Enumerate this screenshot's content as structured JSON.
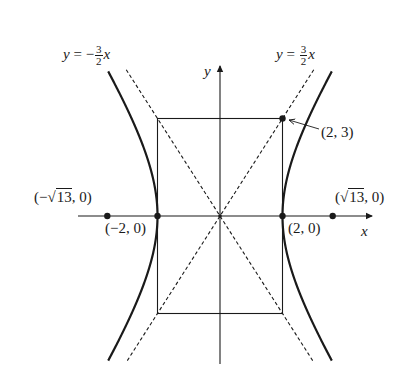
{
  "diagram": {
    "type": "hyperbola",
    "equation_params": {
      "a": 2,
      "b": 3,
      "c_label": "√13"
    },
    "colors": {
      "ink": "#1a1a1a",
      "background": "#ffffff"
    },
    "axes": {
      "x_label": "x",
      "y_label": "y",
      "origin_px": [
        220,
        216
      ],
      "px_per_unit_x": 31.25,
      "px_per_unit_y": 32.5,
      "x_axis_px": [
        78,
        372
      ],
      "y_axis_px": [
        66,
        364
      ]
    },
    "asymptotes": [
      {
        "label_prefix": "y = −",
        "num": "3",
        "den": "2",
        "var": "x",
        "slope": -1.5
      },
      {
        "label_prefix": "y = ",
        "num": "3",
        "den": "2",
        "var": "x",
        "slope": 1.5
      }
    ],
    "points": [
      {
        "label": "(−2, 0)",
        "x": -2,
        "y": 0
      },
      {
        "label": "(2, 0)",
        "x": 2,
        "y": 0
      },
      {
        "label_pre": "(−",
        "label_rad": "13",
        "label_post": ", 0)",
        "x": -3.606,
        "y": 0
      },
      {
        "label_pre": "(",
        "label_rad": "13",
        "label_post": ", 0)",
        "x": 3.606,
        "y": 0
      },
      {
        "label": "(2, 3)",
        "x": 2,
        "y": 3
      }
    ],
    "rectangle": {
      "x_min": -2,
      "x_max": 2,
      "y_min": -3,
      "y_max": 3
    }
  }
}
